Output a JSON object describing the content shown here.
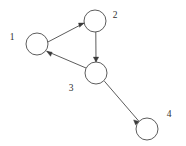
{
  "diagram": {
    "background_color": "#ffffff",
    "stroke_color": "#4a4a4a",
    "arrow_color": "#3a3a3a",
    "label_color": "#303030",
    "node_radius": 11
  },
  "nodes": [
    {
      "id": "1",
      "label": "1",
      "cx": 37,
      "cy": 44,
      "label_x": 12,
      "label_y": 38
    },
    {
      "id": "2",
      "label": "2",
      "cx": 95,
      "cy": 21,
      "label_x": 115,
      "label_y": 16
    },
    {
      "id": "3",
      "label": "3",
      "cx": 96,
      "cy": 73,
      "label_x": 71,
      "label_y": 89
    },
    {
      "id": "4",
      "label": "4",
      "cx": 147,
      "cy": 129,
      "label_x": 169,
      "label_y": 115
    }
  ],
  "edges": [
    {
      "id": "e1",
      "from": "1",
      "to": "2",
      "directed": true,
      "x1": 47.9,
      "y1": 42.0,
      "x2": 84.2,
      "y2": 23.0
    },
    {
      "id": "e2",
      "from": "2",
      "to": "3",
      "directed": true,
      "x1": 95.8,
      "y1": 32.0,
      "x2": 96.0,
      "y2": 62.0
    },
    {
      "id": "e3",
      "from": "3",
      "to": "1",
      "directed": true,
      "x1": 86.0,
      "y1": 68.0,
      "x2": 46.6,
      "y2": 51.2
    },
    {
      "id": "e4",
      "from": "3",
      "to": "4",
      "directed": true,
      "x1": 104.4,
      "y1": 81.2,
      "x2": 139.2,
      "y2": 121.6
    }
  ]
}
